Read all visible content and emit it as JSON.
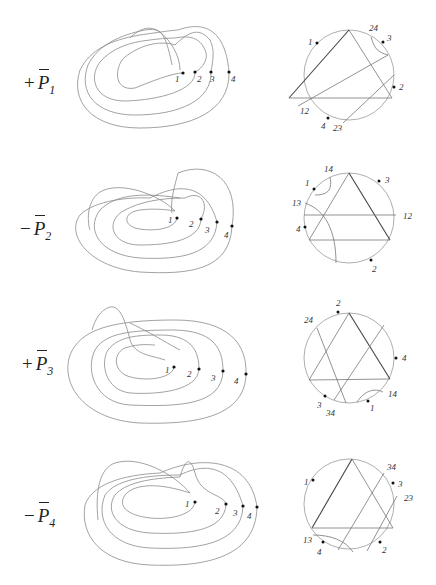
{
  "figure": {
    "rows": [
      {
        "sign": "+",
        "symbol": "P",
        "subscript": "1",
        "curve_points": [
          "1",
          "2",
          "3",
          "4"
        ],
        "chord_labels": [
          "1",
          "24",
          "3",
          "2",
          "12",
          "4",
          "23"
        ]
      },
      {
        "sign": "−",
        "symbol": "P",
        "subscript": "2",
        "curve_points": [
          "1",
          "2",
          "3",
          "4"
        ],
        "chord_labels": [
          "14",
          "1",
          "3",
          "13",
          "12",
          "4",
          "2"
        ]
      },
      {
        "sign": "+",
        "symbol": "P",
        "subscript": "3",
        "curve_points": [
          "1",
          "2",
          "3",
          "4"
        ],
        "chord_labels": [
          "2",
          "24",
          "4",
          "14",
          "3",
          "34",
          "1"
        ]
      },
      {
        "sign": "−",
        "symbol": "P",
        "subscript": "4",
        "curve_points": [
          "1",
          "2",
          "3",
          "4"
        ],
        "chord_labels": [
          "1",
          "34",
          "3",
          "23",
          "13",
          "4",
          "2"
        ]
      }
    ]
  }
}
